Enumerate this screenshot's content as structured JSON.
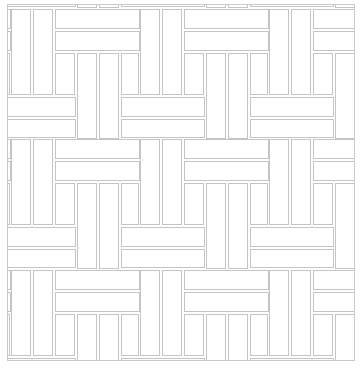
{
  "pattern": {
    "name": "basketweave tile pattern",
    "line_color": "#c4c4c4",
    "background": "#ffffff",
    "frame": {
      "x": 7,
      "y": 4,
      "width": 348,
      "height": 357
    },
    "block_period": {
      "x": 129,
      "y": 131
    },
    "block_origins_x": [
      3,
      132,
      261,
      -126
    ],
    "block_origins_y": [
      4,
      134,
      265,
      -127
    ],
    "block_tiles": [
      {
        "role": "vertical-long",
        "x": 0,
        "y": 0,
        "w": 20,
        "h": 86
      },
      {
        "role": "vertical-long",
        "x": 22,
        "y": 0,
        "w": 20,
        "h": 86
      },
      {
        "role": "horizontal",
        "x": 44,
        "y": 0,
        "w": 85,
        "h": 20
      },
      {
        "role": "horizontal",
        "x": 44,
        "y": 22,
        "w": 85,
        "h": 20
      },
      {
        "role": "vertical-short",
        "x": 44,
        "y": 44,
        "w": 20,
        "h": 42
      },
      {
        "role": "vertical-long",
        "x": 66,
        "y": 44,
        "w": 20,
        "h": 86
      },
      {
        "role": "vertical-long",
        "x": 88,
        "y": 44,
        "w": 20,
        "h": 86
      },
      {
        "role": "vertical-short",
        "x": 110,
        "y": 44,
        "w": 18,
        "h": 42
      },
      {
        "role": "horizontal",
        "x": 110,
        "y": 88,
        "w": 84,
        "h": 20
      },
      {
        "role": "horizontal",
        "x": 110,
        "y": 110,
        "w": 84,
        "h": 19
      }
    ]
  }
}
